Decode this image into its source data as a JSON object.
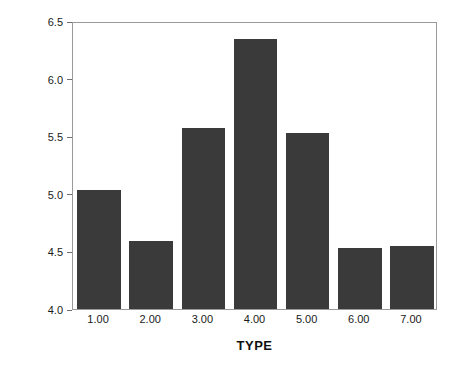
{
  "chart_data": {
    "type": "bar",
    "title": "",
    "subtitle": "",
    "xlabel": "TYPE",
    "ylabel": "DOCTOR9 Score",
    "categories": [
      "1.00",
      "2.00",
      "3.00",
      "4.00",
      "5.00",
      "6.00",
      "7.00"
    ],
    "values": [
      5.03,
      4.59,
      5.57,
      6.34,
      5.53,
      4.53,
      4.55
    ],
    "ylim": [
      4.0,
      6.5
    ],
    "ytick_labels": [
      "4.0",
      "4.5",
      "5.0",
      "5.5",
      "6.0",
      "6.5"
    ],
    "ytick_values": [
      4.0,
      4.5,
      5.0,
      5.5,
      6.0,
      6.5
    ],
    "grid": false,
    "legend": false,
    "legend_position": "none",
    "bar_color": "#3a3a3a",
    "background_color": "#ffffff",
    "axis_color": "#9a9a9a"
  }
}
